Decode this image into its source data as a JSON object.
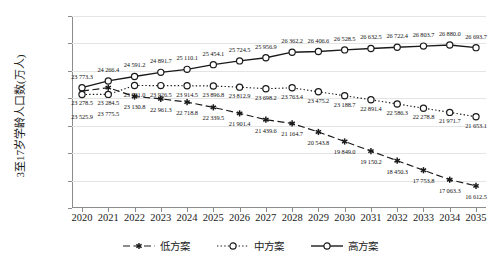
{
  "chart_data": {
    "type": "line",
    "title": "",
    "xlabel": "",
    "ylabel": "3至17岁学龄人口数(万人)",
    "ylim": [
      15000,
      29000
    ],
    "ytick_labels": [
      "29 000.0",
      "27 000.0",
      "25 000.0",
      "23 000.0",
      "21 000.0",
      "19 000.0",
      "17 000.0",
      "15 000.0"
    ],
    "ytick_values": [
      29000,
      27000,
      25000,
      23000,
      21000,
      19000,
      17000,
      15000
    ],
    "grid": true,
    "legend_position": "bottom",
    "categories": [
      "2020",
      "2021",
      "2022",
      "2023",
      "2024",
      "2025",
      "2026",
      "2027",
      "2028",
      "2029",
      "2030",
      "2031",
      "2032",
      "2033",
      "2034",
      "2035"
    ],
    "x": [
      2020,
      2021,
      2022,
      2023,
      2024,
      2025,
      2026,
      2027,
      2028,
      2029,
      2030,
      2031,
      2032,
      2033,
      2034,
      2035
    ],
    "series": [
      {
        "name": "低方案",
        "key": "low",
        "marker": "asterisk",
        "line_style": "dashed",
        "color": "#1a1a1a",
        "values": [
          23525.9,
          23775.5,
          23130.8,
          22961.3,
          22718.8,
          22339.5,
          21901.4,
          21439.6,
          21164.7,
          20543.8,
          19849.0,
          19150.2,
          18450.3,
          17753.8,
          17063.3,
          16612.5
        ],
        "labels": [
          "23 525.9",
          "23 775.5",
          "23 130.8",
          "22 961.3",
          "22 718.8",
          "22 339.5",
          "21 901.4",
          "21 439.6",
          "21 164.7",
          "20 543.8",
          "19 849.0",
          "19 150.2",
          "18 450.3",
          "17 753.8",
          "17 063.3",
          "16 612.5"
        ]
      },
      {
        "name": "中方案",
        "key": "medium",
        "marker": "circle-open",
        "line_style": "dotted",
        "color": "#1a1a1a",
        "values": [
          23278.5,
          23284.5,
          23931.0,
          23926.5,
          23914.5,
          23896.8,
          23812.9,
          23698.2,
          23763.4,
          23475.2,
          23188.7,
          22891.4,
          22586.3,
          22278.8,
          21971.7,
          21653.1
        ],
        "labels": [
          "23 278.5",
          "23 284.5",
          "23 931.0",
          "23 926.5",
          "23 914.5",
          "23 896.8",
          "23 812.9",
          "23 698.2",
          "23 763.4",
          "23 475.2",
          "23 188.7",
          "22 891.4",
          "22 586.3",
          "22 278.8",
          "21 971.7",
          "21 653.1"
        ]
      },
      {
        "name": "高方案",
        "key": "high",
        "marker": "circle-open",
        "line_style": "solid",
        "color": "#1a1a1a",
        "values": [
          23773.3,
          24266.4,
          24591.2,
          24891.7,
          25110.1,
          25454.1,
          25724.5,
          25956.9,
          26362.2,
          26406.6,
          26528.5,
          26632.5,
          26722.4,
          26803.7,
          26880.0,
          26693.7
        ],
        "labels": [
          "23 773.3",
          "24 266.4",
          "24 591.2",
          "24 891.7",
          "25 110.1",
          "25 454.1",
          "25 724.5",
          "25 956.9",
          "26 362.2",
          "26 406.6",
          "26 528.5",
          "26 632.5",
          "26 722.4",
          "26 803.7",
          "26 880.0",
          "26 693.7"
        ]
      }
    ]
  },
  "legend": {
    "items": [
      {
        "label": "低方案"
      },
      {
        "label": "中方案"
      },
      {
        "label": "高方案"
      }
    ]
  },
  "colors": {
    "axis": "#8c8c8c",
    "grid": "#e4e4e4",
    "text": "#1a1a1a",
    "series": "#1a1a1a"
  }
}
